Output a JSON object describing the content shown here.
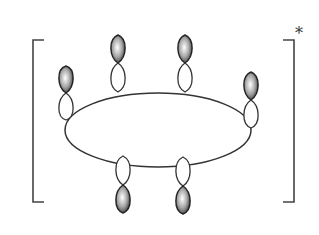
{
  "diagram": {
    "title": "",
    "type": "p-orbital ring (cyclic conjugated system) in brackets",
    "superscript_label": "*",
    "ring": {
      "shape": "ellipse",
      "cx": 158,
      "cy": 130,
      "rx": 95,
      "ry": 38
    },
    "orbitals": [
      {
        "id": "p1",
        "x": 66,
        "y": 108,
        "shaded_lobe": "up"
      },
      {
        "id": "p2",
        "x": 117,
        "y": 92,
        "shaded_lobe": "up"
      },
      {
        "id": "p3",
        "x": 184,
        "y": 92,
        "shaded_lobe": "up"
      },
      {
        "id": "p4",
        "x": 250,
        "y": 108,
        "shaded_lobe": "up"
      },
      {
        "id": "p5",
        "x": 124,
        "y": 160,
        "shaded_lobe": "down"
      },
      {
        "id": "p6",
        "x": 184,
        "y": 160,
        "shaded_lobe": "down"
      }
    ],
    "brackets": {
      "left_x": 33,
      "right_x": 294,
      "top_y": 40,
      "bottom_y": 202
    },
    "colors": {
      "line": "#333333",
      "shade_dark": "#4a4a4a",
      "shade_light": "#ffffff"
    }
  }
}
